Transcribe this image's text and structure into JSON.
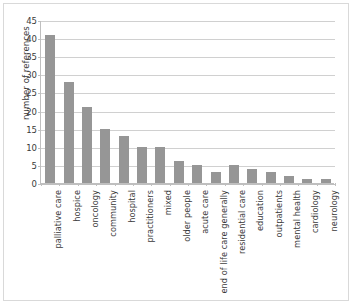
{
  "chart_data": {
    "type": "bar",
    "title": "",
    "xlabel": "",
    "ylabel": "number of references",
    "ylim": [
      0,
      45
    ],
    "yticks": [
      0,
      5,
      10,
      15,
      20,
      25,
      30,
      35,
      40,
      45
    ],
    "grid": true,
    "legend": null,
    "bar_color": "#969696",
    "gridline_color": "#d0d0d0",
    "axis_color": "#bfbfbf",
    "categories": [
      "palliative care",
      "hospice",
      "oncology",
      "community",
      "hospital",
      "practitioners",
      "mixed",
      "older people",
      "acute care",
      "end of life care generally",
      "residential care",
      "education",
      "outpatients",
      "mental health",
      "cardiology",
      "neurology"
    ],
    "values": [
      41,
      28,
      21,
      15,
      13,
      10,
      10,
      6,
      5,
      3,
      5,
      4,
      3,
      2,
      1,
      1
    ]
  }
}
